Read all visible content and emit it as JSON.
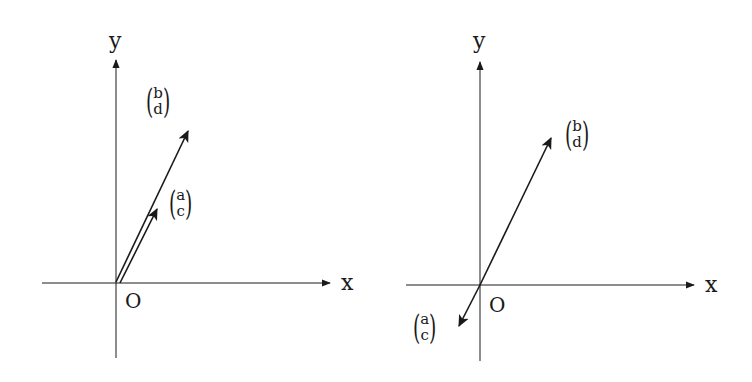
{
  "diagrams": [
    {
      "id": "left",
      "axes": {
        "x_label": "x",
        "y_label": "y",
        "origin_label": "O"
      },
      "vectors": [
        {
          "name": "b-d",
          "top": "b",
          "bottom": "d",
          "description": "long vector from origin, up-right"
        },
        {
          "name": "a-c",
          "top": "a",
          "bottom": "c",
          "description": "shorter vector, same direction as (b,d)"
        }
      ]
    },
    {
      "id": "right",
      "axes": {
        "x_label": "x",
        "y_label": "y",
        "origin_label": "O"
      },
      "vectors": [
        {
          "name": "b-d",
          "top": "b",
          "bottom": "d",
          "description": "vector from origin, up-right"
        },
        {
          "name": "a-c",
          "top": "a",
          "bottom": "c",
          "description": "vector from origin, opposite direction (down-left)"
        }
      ]
    }
  ],
  "colors": {
    "stroke": "#1a1a1a",
    "background": "#ffffff"
  }
}
